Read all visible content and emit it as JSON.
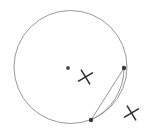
{
  "figure": {
    "title": "Circle with chord, arc and two X marks",
    "background_color": "#ffffff",
    "width": 148,
    "height": 140
  },
  "chart_data": {
    "type": "scatter",
    "title": "Circle with chord, arc and two X marks",
    "xlabel": "",
    "ylabel": "",
    "grid": false,
    "legend": "none",
    "xlim": [
      0,
      148
    ],
    "ylim": [
      0,
      140
    ],
    "shapes": [
      {
        "name": "main-circle",
        "kind": "circle",
        "cx": 70.5,
        "cy": 67.0,
        "r": 56.5,
        "stroke": "#8c8c8c",
        "stroke_width": 0.9,
        "fill": "none"
      },
      {
        "name": "chord-segment",
        "kind": "line",
        "x1": 124.0,
        "y1": 68.0,
        "x2": 91.0,
        "y2": 120.0,
        "stroke": "#8a8a8a",
        "stroke_width": 0.9
      },
      {
        "name": "arc-segment",
        "kind": "arc",
        "x1": 124.0,
        "y1": 68.0,
        "x2": 91.0,
        "y2": 120.0,
        "rx": 56.5,
        "ry": 56.5,
        "sweep": 1,
        "large_arc": 0,
        "stroke": "#8a8a8a",
        "stroke_width": 0.9
      }
    ],
    "points": [
      {
        "name": "center-point",
        "label": "",
        "x": 68.0,
        "y": 68.0,
        "r": 1.9,
        "color": "#4a4a4a"
      },
      {
        "name": "upper-right-point",
        "label": "",
        "x": 124.0,
        "y": 68.0,
        "r": 2.2,
        "color": "#3a3a3a"
      },
      {
        "name": "lower-point",
        "label": "",
        "x": 91.0,
        "y": 120.0,
        "r": 2.2,
        "color": "#3a3a3a"
      }
    ],
    "marks": [
      {
        "name": "inner-x-mark",
        "glyph": "x",
        "cx": 85.5,
        "cy": 77.0,
        "size": 11.5,
        "rotation": 14,
        "stroke": "#2b2b2b",
        "stroke_width": 1.5
      },
      {
        "name": "outer-x-mark",
        "glyph": "x",
        "cx": 131.5,
        "cy": 113.0,
        "size": 11.5,
        "rotation": 14,
        "stroke": "#2b2b2b",
        "stroke_width": 1.5
      }
    ]
  }
}
